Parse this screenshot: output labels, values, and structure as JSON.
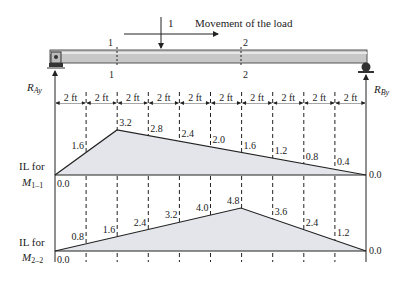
{
  "load": {
    "label": "1",
    "movement_label": "Movement of the load"
  },
  "sections": {
    "s1_top": "1",
    "s1_bottom": "1",
    "s2_top": "2",
    "s2_bottom": "2"
  },
  "reactions": {
    "left": "R",
    "left_sub": "Ay",
    "right": "R",
    "right_sub": "By"
  },
  "spacing_label": "2 ft",
  "spacing_count": 10,
  "il1": {
    "title_line1": "IL for",
    "title_line2": "M",
    "title_sub": "1–1",
    "values": [
      "0.0",
      "1.6",
      "3.2",
      "2.8",
      "2.4",
      "2.0",
      "1.6",
      "1.2",
      "0.8",
      "0.4",
      "0.0"
    ]
  },
  "il2": {
    "title_line1": "IL for",
    "title_line2": "M",
    "title_sub": "2–2",
    "values": [
      "0.0",
      "0.8",
      "1.6",
      "2.4",
      "3.2",
      "4.0",
      "4.8",
      "3.6",
      "2.4",
      "1.2",
      "0.0"
    ]
  },
  "colors": {
    "beam": "#c8c8c8",
    "fill": "#e3e5ea",
    "line": "#222222"
  }
}
